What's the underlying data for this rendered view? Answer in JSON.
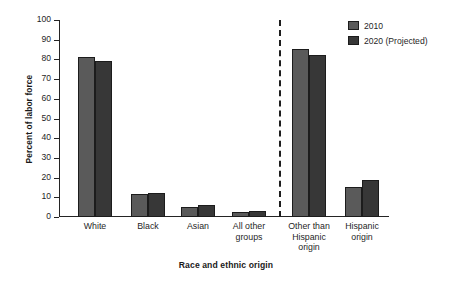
{
  "chart_data": {
    "type": "bar",
    "title": "",
    "xlabel": "Race and ethnic origin",
    "ylabel": "Percent of labor force",
    "ylim": [
      0,
      100
    ],
    "yticks": [
      0,
      10,
      20,
      30,
      40,
      50,
      60,
      70,
      80,
      90,
      100
    ],
    "grid": false,
    "legend_position": "top-right",
    "categories": [
      "White",
      "Black",
      "Asian",
      "All other\ngroups",
      "Other than\nHispanic\norigin",
      "Hispanic\norigin"
    ],
    "series": [
      {
        "name": "2010",
        "color": "#5a5a5a",
        "values": [
          81,
          11.5,
          5,
          2.5,
          85.5,
          15
        ]
      },
      {
        "name": "2020 (Projected)",
        "color": "#373737",
        "values": [
          79,
          12,
          6,
          3,
          82,
          19
        ]
      }
    ],
    "annotations": [
      {
        "type": "vertical-dashed-divider",
        "after_category_index": 3
      }
    ]
  },
  "legend": {
    "items": [
      {
        "label": "2010"
      },
      {
        "label": "2020 (Projected)"
      }
    ]
  },
  "axes": {
    "y_title": "Percent of labor force",
    "x_title": "Race and ethnic origin",
    "y_tick_labels": [
      "100",
      "90",
      "80",
      "70",
      "60",
      "50",
      "40",
      "30",
      "20",
      "10",
      "0"
    ]
  }
}
